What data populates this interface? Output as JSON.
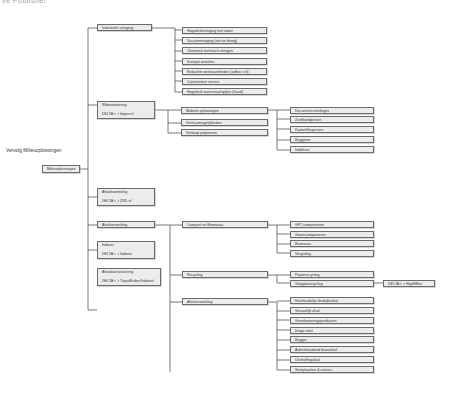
{
  "header": {
    "cut_text": "ve Publisher"
  },
  "diagram": {
    "title": "Vervolg Milieuoplossingen",
    "root": "Milieuoplossingen",
    "level1": [
      {
        "label": "Industriële reiniging"
      },
      {
        "label": "Slibontwatering",
        "sub": "DELTA < > Impex.nl"
      },
      {
        "label": "Afvalinzameling",
        "sub": "DELTA < > ZRD.nl"
      },
      {
        "label": "Afvalverwerking"
      },
      {
        "label": "Indover",
        "sub": "DELTA < > Indover"
      },
      {
        "label": "Afvalwaterzuivering",
        "sub": "DELTA < > Tripat/Eviber/Indover/"
      }
    ],
    "industriele_reiniging": [
      "Hogedrukreiniging met water",
      "Vacuümreiniging (nat en droog)",
      "Chemisch technisch reinigen",
      "Katalyst wisselen",
      "Beduchte werkzaamheden (adhoc crit)",
      "Calamiteiten service",
      "Hogedruk waterstraalspijlen (fraud)"
    ],
    "slibontwatering": [
      "Mobiele oplossingen",
      "Verhuurmogelijkheden",
      "Verkoop polymeren"
    ],
    "mobiele_oplossingen": [
      "Decanteercentrifuges",
      "Zeefbandpersen",
      "Kamerfilterpersen",
      "Baggeren",
      "Indikkers"
    ],
    "afvalverwerking": [
      "Compost en Biomassa",
      "Recycling",
      "Afvalverwerking"
    ],
    "compost": [
      "GFT-composteren",
      "Groencomposteren",
      "Biomassa",
      "Vergisting"
    ],
    "recycling": [
      "Papierrecycling",
      "Vlakglasrecycling"
    ],
    "recycling_partner": "DELTA < > HighEBee",
    "afval_sub": [
      "Huishoudelijk-/bedrijfsafval",
      "Gevaarlijk afval",
      "Grondsaneringsproducten",
      "Droge stort",
      "Bagger",
      "Asbesthoudend bouwafval",
      "Onsholfingafval",
      "Stortplaatsen & contact"
    ]
  }
}
